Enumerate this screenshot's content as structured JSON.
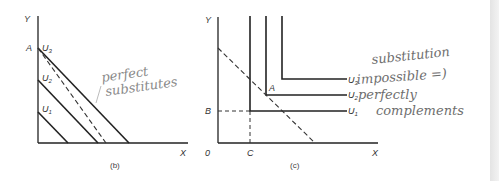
{
  "panel_b": {
    "caption": "(b)",
    "y_axis_label": "Y",
    "x_axis_label": "X",
    "intercept_label": "A",
    "curves": [
      {
        "label": "U",
        "sub": "1"
      },
      {
        "label": "U",
        "sub": "2"
      },
      {
        "label": "U",
        "sub": "3"
      }
    ],
    "annotation": [
      "perfect",
      "substitutes"
    ]
  },
  "panel_c": {
    "caption": "(c)",
    "y_axis_label": "Y",
    "x_axis_label": "X",
    "origin_label": "0",
    "point_label": "A",
    "b_label": "B",
    "c_label": "C",
    "curves": [
      {
        "label": "U",
        "sub": "1"
      },
      {
        "label": "U",
        "sub": "2"
      },
      {
        "label": "U",
        "sub": "3"
      }
    ],
    "annotation": [
      "substitution",
      "impossible =)",
      "perfectly",
      "complements"
    ]
  },
  "colors": {
    "ink": "#222222",
    "handwriting": "#8a8a8a"
  }
}
